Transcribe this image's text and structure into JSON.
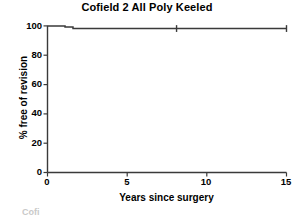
{
  "chart_data": {
    "type": "line",
    "title": "Cofield 2 All Poly Keeled",
    "xlabel": "Years since surgery",
    "ylabel": "% free of revision",
    "xlim": [
      0,
      15
    ],
    "ylim": [
      0,
      100
    ],
    "xticks": [
      0,
      5,
      10,
      15
    ],
    "xtick_labels": [
      "0",
      "5",
      "10",
      "15"
    ],
    "yticks": [
      0,
      20,
      40,
      60,
      80,
      100
    ],
    "ytick_labels": [
      "0",
      "20",
      "40",
      "60",
      "80",
      "100"
    ],
    "grid": false,
    "legend": false,
    "series": [
      {
        "name": "Cofield 2 All Poly Keeled",
        "style": "kaplan-meier-step",
        "color": "#3a3a3a",
        "x": [
          0.0,
          1.1,
          1.1,
          1.6,
          1.6,
          15.0
        ],
        "y": [
          100.0,
          100.0,
          99.2,
          99.2,
          98.2,
          98.2
        ]
      }
    ],
    "censor_marks": [
      {
        "x": 8.1,
        "y": 98.2
      },
      {
        "x": 15.0,
        "y": 98.2
      }
    ],
    "annotations": []
  },
  "figure": {
    "title": "Cofield 2 All Poly Keeled",
    "x_axis_label": "Years since surgery",
    "y_axis_label": "% free of revision",
    "y_tick_labels": [
      "100",
      "80",
      "60",
      "40",
      "20",
      "0"
    ],
    "x_tick_labels": [
      "0",
      "5",
      "10",
      "15"
    ],
    "axis_color": "#3a3a3a",
    "curve_color": "#3a3a3a",
    "background": "#ffffff",
    "scan_artifact_text": "Cofi"
  }
}
